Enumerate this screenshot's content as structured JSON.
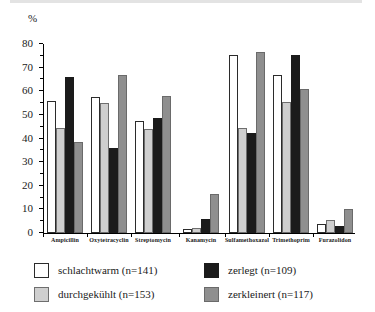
{
  "chart_data": {
    "type": "bar",
    "title": "",
    "subtitle": "",
    "xlabel": "",
    "ylabel": "%",
    "ylim": [
      0,
      80
    ],
    "ytick_step": 10,
    "yticks": [
      "0",
      "10",
      "20",
      "30",
      "40",
      "50",
      "60",
      "70",
      "80"
    ],
    "grid": false,
    "legend_position": "bottom",
    "categories": [
      "Ampicillin",
      "Oxytetracyclin",
      "Streptomycin",
      "Kanamycin",
      "Sulfamethoxazol",
      "Trimethoprim",
      "Furazolidon"
    ],
    "series": [
      {
        "name": "schlachtwarm (n=141)",
        "key": "schlachtwarm",
        "color": "#ffffff",
        "values": [
          56,
          57.5,
          47.5,
          1.5,
          75.5,
          67,
          4
        ]
      },
      {
        "name": "durchgekühlt (n=153)",
        "key": "durchgekuehlt",
        "color": "#cfcfcf",
        "values": [
          44.5,
          55,
          44,
          2,
          44.5,
          55.5,
          5.5
        ]
      },
      {
        "name": "zerlegt (n=109)",
        "key": "zerlegt",
        "color": "#1b1b1b",
        "values": [
          66,
          36,
          48.5,
          6,
          42.5,
          75.5,
          3
        ]
      },
      {
        "name": "zerkleinert (n=117)",
        "key": "zerkleinert",
        "color": "#8f8f8f",
        "values": [
          38.5,
          67,
          58,
          16.5,
          76.5,
          61,
          10
        ]
      }
    ]
  },
  "legend": {
    "items": [
      {
        "label": "schlachtwarm (n=141)",
        "key": "schlachtwarm"
      },
      {
        "label": "zerlegt (n=109)",
        "key": "zerlegt"
      },
      {
        "label": "durchgekühlt (n=153)",
        "key": "durchgekuehlt"
      },
      {
        "label": "zerkleinert (n=117)",
        "key": "zerkleinert"
      }
    ]
  },
  "axis": {
    "percent_symbol": "%"
  }
}
